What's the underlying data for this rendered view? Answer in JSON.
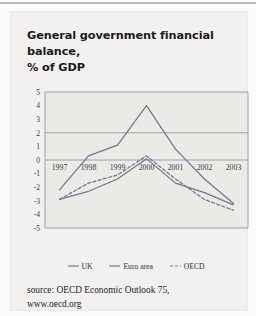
{
  "figure": {
    "title_line1": "General government financial balance,",
    "title_line2": "% of GDP",
    "source_line1": "source: OECD Economic Outlook 75,",
    "source_line2": "www.oecd.org"
  },
  "colors": {
    "line": "#6b7a8d",
    "grid": "#8e9aa6",
    "panel": "#eceae7",
    "card": "#f2f1ef",
    "text": "#1b1b1b"
  },
  "legend": {
    "position": "bottom",
    "items": [
      {
        "label": "UK",
        "style": "solid"
      },
      {
        "label": "Euro area",
        "style": "solid"
      },
      {
        "label": "OECD",
        "style": "dashed"
      }
    ]
  },
  "chart_data": {
    "type": "line",
    "title": "General government financial balance, % of GDP",
    "xlabel": "",
    "ylabel": "",
    "x": [
      "1997",
      "1998",
      "1999",
      "2000",
      "2001",
      "2002",
      "2003"
    ],
    "categories": [
      "1997",
      "1998",
      "1999",
      "2000",
      "2001",
      "2002",
      "2003"
    ],
    "ylim": [
      -5,
      5
    ],
    "yticks": [
      5,
      4,
      3,
      2,
      1,
      0,
      -1,
      -2,
      -3,
      -4,
      -5
    ],
    "ytick_labels": [
      "5",
      "4",
      "3",
      "2",
      "1",
      "0",
      "-1",
      "-2",
      "-3",
      "-4",
      "-5"
    ],
    "gridlines": [
      5,
      2,
      0,
      -5
    ],
    "grid": true,
    "series": [
      {
        "name": "UK",
        "style": "solid",
        "values": [
          -2.2,
          0.3,
          1.1,
          4.0,
          0.8,
          -1.4,
          -3.2
        ]
      },
      {
        "name": "Euro area",
        "style": "solid",
        "values": [
          -2.9,
          -2.3,
          -1.4,
          0.1,
          -1.7,
          -2.4,
          -3.3
        ]
      },
      {
        "name": "OECD",
        "style": "dashed",
        "values": [
          -2.9,
          -1.7,
          -1.1,
          0.3,
          -1.4,
          -2.9,
          -3.7
        ]
      }
    ]
  }
}
